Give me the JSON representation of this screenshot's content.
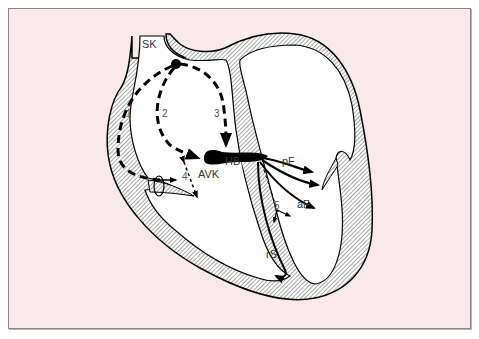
{
  "diagram": {
    "colors": {
      "background": "#f9e9ea",
      "wall_hatch": "#555555",
      "ink": "#000000",
      "chamber": "#ffffff"
    },
    "labels": {
      "sinus_node": "SK",
      "av_node": "AVK",
      "his_bundle": "HB",
      "posterior_fascicle": "pF",
      "anterior_fascicle": "aF",
      "right_bundle": "rS"
    },
    "pathways": [
      {
        "id": "1",
        "label": "1"
      },
      {
        "id": "2",
        "label": "2"
      },
      {
        "id": "3",
        "label": "3"
      },
      {
        "id": "4",
        "label": "4"
      },
      {
        "id": "5",
        "label": "5"
      }
    ]
  }
}
